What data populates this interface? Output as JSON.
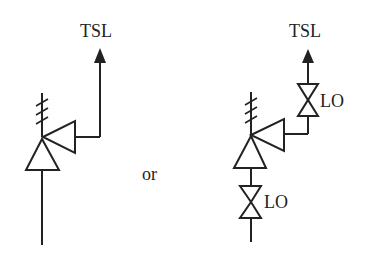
{
  "diagram": {
    "type": "instrument symbol alternatives",
    "colors": {
      "stroke": "#222222",
      "background": "#ffffff"
    },
    "separator_label": "or",
    "left_option": {
      "output_label": "TSL",
      "components": [
        "signal-arrow",
        "thermal-element",
        "switch-symbol",
        "process-line"
      ]
    },
    "right_option": {
      "output_label": "TSL",
      "upper_valve_label": "LO",
      "lower_valve_label": "LO",
      "components": [
        "signal-arrow",
        "upper-valve",
        "thermal-element",
        "switch-symbol",
        "lower-valve",
        "process-line"
      ]
    }
  }
}
